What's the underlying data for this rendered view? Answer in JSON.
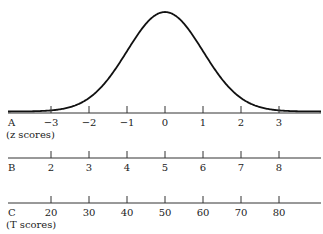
{
  "chart_data": {
    "type": "line",
    "title": "",
    "curve": {
      "distribution": "normal",
      "mean": 0,
      "sd": 1
    },
    "xlim": [
      -4.2,
      4.0
    ],
    "grid": false,
    "scales": [
      {
        "id": "A",
        "label": "A",
        "sublabel": "(z scores)",
        "ticks": [
          -3,
          -2,
          -1,
          0,
          1,
          2,
          3
        ],
        "tick_labels": [
          "−3",
          "−2",
          "−1",
          "0",
          "1",
          "2",
          "3"
        ]
      },
      {
        "id": "B",
        "label": "B",
        "sublabel": "",
        "ticks": [
          -3,
          -2,
          -1,
          0,
          1,
          2,
          3
        ],
        "tick_labels": [
          "2",
          "3",
          "4",
          "5",
          "6",
          "7",
          "8"
        ]
      },
      {
        "id": "C",
        "label": "C",
        "sublabel": "(T scores)",
        "ticks": [
          -3,
          -2,
          -1,
          0,
          1,
          2,
          3
        ],
        "tick_labels": [
          "20",
          "30",
          "40",
          "50",
          "60",
          "70",
          "80"
        ]
      }
    ]
  }
}
